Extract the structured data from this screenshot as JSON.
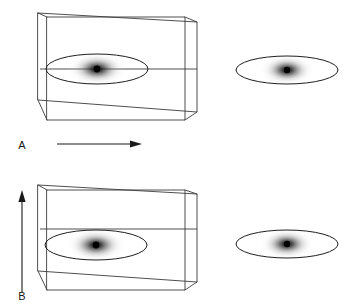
{
  "figure": {
    "background_color": "#ffffff",
    "line_color": "#3b3b3b",
    "outline_color": "#1f1f1f",
    "label_color": "#1a1a1a",
    "blob_color": "#000000",
    "width": 353,
    "height": 305
  },
  "panels": [
    {
      "id": "A",
      "label": "A",
      "label_x": 22,
      "label_y": 149,
      "arrow": {
        "name": "horizontal-arrow",
        "orientation": "horizontal",
        "direction": "right",
        "x1": 57,
        "y1": 144,
        "x2": 141,
        "y2": 144
      },
      "box": {
        "name": "wireframe-box-a",
        "front_left_x": 47,
        "front_right_x": 185,
        "front_top_y": 17,
        "front_bottom_y": 120,
        "back_left_x": 38,
        "back_right_x": 197,
        "back_top_y": 13,
        "back_bottom_y": 112,
        "mid_line_y": 69
      },
      "inner_disk": {
        "name": "density-disk-a",
        "cx": 97,
        "cy": 69,
        "rx": 51,
        "ry": 15,
        "blob_rx": 30,
        "blob_ry": 17,
        "dot_r": 3.4
      },
      "outer_disk": {
        "name": "density-disk-a-detached",
        "cx": 287,
        "cy": 70,
        "rx": 51,
        "ry": 14,
        "blob_rx": 28,
        "blob_ry": 16,
        "dot_r": 3.2
      }
    },
    {
      "id": "B",
      "label": "B",
      "label_x": 22,
      "label_y": 300,
      "arrow": {
        "name": "vertical-arrow",
        "orientation": "vertical",
        "direction": "up",
        "x1": 22,
        "y1": 293,
        "x2": 22,
        "y2": 191
      },
      "box": {
        "name": "wireframe-box-b",
        "front_left_x": 47,
        "front_right_x": 185,
        "front_top_y": 190,
        "front_bottom_y": 290,
        "back_left_x": 38,
        "back_right_x": 197,
        "back_top_y": 185,
        "back_bottom_y": 282,
        "mid_line_y": 229
      },
      "inner_disk": {
        "name": "density-disk-b",
        "cx": 96,
        "cy": 245,
        "rx": 51,
        "ry": 15,
        "blob_rx": 30,
        "blob_ry": 17,
        "dot_r": 3.4
      },
      "outer_disk": {
        "name": "density-disk-b-detached",
        "cx": 287,
        "cy": 244,
        "rx": 51,
        "ry": 14,
        "blob_rx": 28,
        "blob_ry": 16,
        "dot_r": 3.2
      }
    }
  ]
}
